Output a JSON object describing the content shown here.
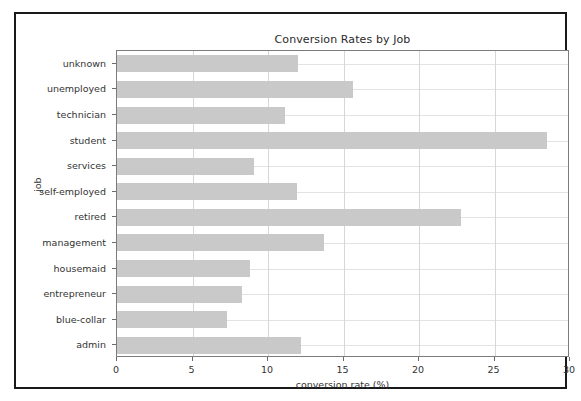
{
  "figure": {
    "background": "#ffffff",
    "frame_color": "#19191b",
    "bar_color": "#c9c9c9",
    "grid_color": "#d6d6d6",
    "axis_color": "#7c7c7c"
  },
  "chart_data": {
    "type": "bar",
    "orientation": "horizontal",
    "title": "Conversion Rates by Job",
    "xlabel": "conversion rate (%)",
    "ylabel": "job",
    "categories": [
      "admin",
      "blue-collar",
      "entrepreneur",
      "housemaid",
      "management",
      "retired",
      "self-employed",
      "services",
      "student",
      "technician",
      "unemployed",
      "unknown"
    ],
    "values": [
      12.2,
      7.3,
      8.3,
      8.8,
      13.7,
      22.8,
      11.9,
      9.1,
      28.5,
      11.1,
      15.6,
      12.0
    ],
    "xlim": [
      0,
      30
    ],
    "xticks": [
      0,
      5,
      10,
      15,
      20,
      25,
      30
    ],
    "xtick_labels": [
      "0",
      "5",
      "10",
      "15",
      "20",
      "25",
      "30"
    ],
    "grid": true,
    "legend": null
  }
}
